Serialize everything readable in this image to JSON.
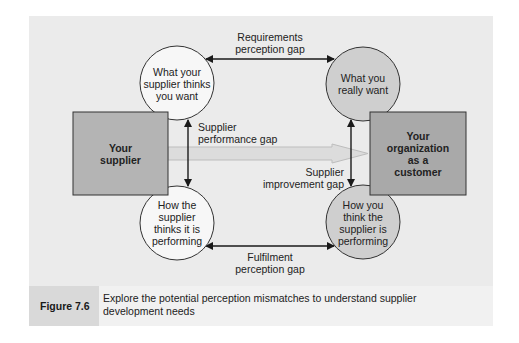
{
  "diagram": {
    "nodes": {
      "supplier_box": "Your supplier",
      "supplier_box_lines": [
        "Your",
        "supplier"
      ],
      "customer_box": "Your organization as a customer",
      "customer_box_lines": [
        "Your",
        "organization",
        "as a",
        "customer"
      ],
      "circle_top_left": "What your supplier thinks you want",
      "circle_top_left_lines": [
        "What your",
        "supplier thinks",
        "you want"
      ],
      "circle_top_right": "What you really want",
      "circle_top_right_lines": [
        "What you",
        "really want"
      ],
      "circle_bottom_left": "How the supplier thinks it is performing",
      "circle_bottom_left_lines": [
        "How the",
        "supplier",
        "thinks it is",
        "performing"
      ],
      "circle_bottom_right": "How you think the supplier is performing",
      "circle_bottom_right_lines": [
        "How you",
        "think the",
        "supplier is",
        "performing"
      ]
    },
    "gaps": {
      "requirements": [
        "Requirements",
        "perception gap"
      ],
      "supplier_performance": [
        "Supplier",
        "performance gap"
      ],
      "supplier_improvement": [
        "Supplier",
        "improvement gap"
      ],
      "fulfilment": [
        "Fulfilment",
        "perception gap"
      ]
    },
    "colors": {
      "panel_bg": "#ebebeb",
      "box_fill": "#b4b4b4",
      "white_circle": "#f7f7f7",
      "grey_circle": "#cfcfcf",
      "big_arrow": "#d8d8d8",
      "line": "#1a1a1a"
    }
  },
  "caption": {
    "figure_number": "Figure 7.6",
    "text_line1": "Explore the potential perception mismatches to understand supplier",
    "text_line2": "development needs"
  }
}
